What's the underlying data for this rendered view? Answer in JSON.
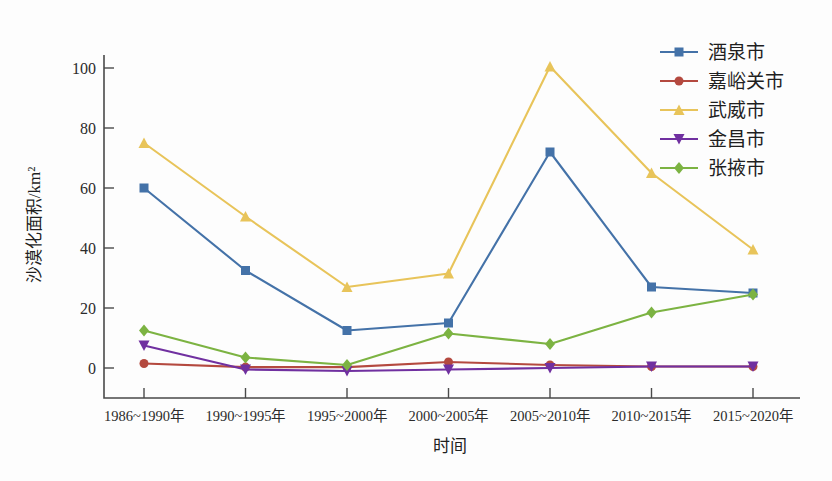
{
  "chart_data": {
    "type": "line",
    "title": "",
    "xlabel": "时间",
    "ylabel": "沙漠化面积/km²",
    "categories": [
      "1986~1990年",
      "1990~1995年",
      "1995~2000年",
      "2000~2005年",
      "2005~2010年",
      "2010~2015年",
      "2015~2020年"
    ],
    "ylim": [
      0,
      105
    ],
    "yticks": [
      "0",
      "20",
      "40",
      "60",
      "80",
      "100"
    ],
    "ytick_values": [
      0,
      20,
      40,
      60,
      80,
      100
    ],
    "grid": false,
    "legend_position": "top-right",
    "series": [
      {
        "name": "酒泉市",
        "color": "#4472a8",
        "marker": "square",
        "values": [
          60,
          32.5,
          12.5,
          15,
          72,
          27,
          25
        ]
      },
      {
        "name": "嘉峪关市",
        "color": "#b4493f",
        "marker": "circle",
        "values": [
          1.5,
          0.3,
          0.3,
          2,
          1,
          0.5,
          0.5
        ]
      },
      {
        "name": "武威市",
        "color": "#e2b councils"
      }
    ]
  }
}
